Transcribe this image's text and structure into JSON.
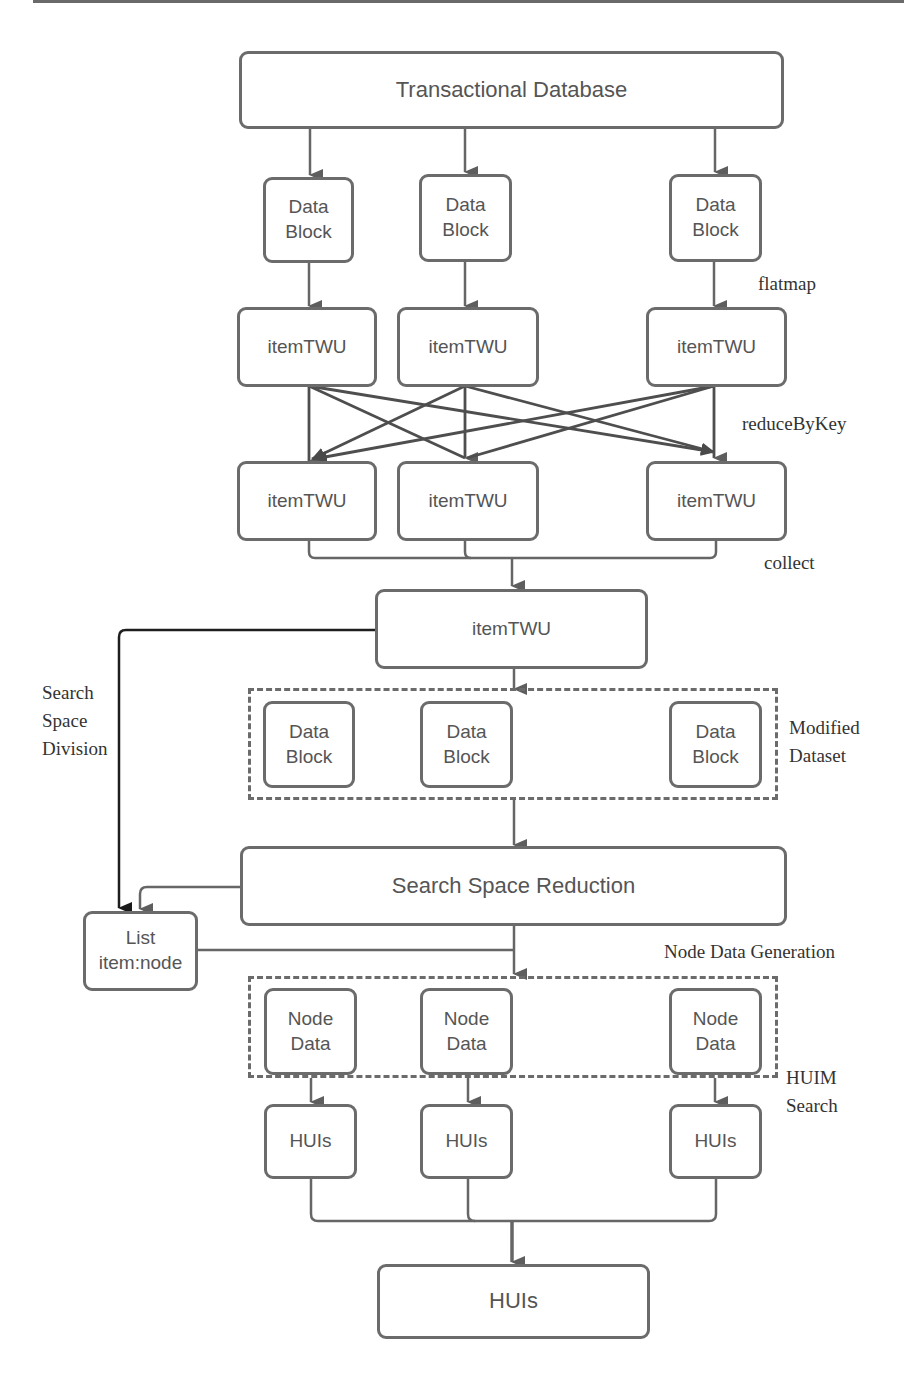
{
  "diagram": {
    "colors": {
      "stroke": "#6b6b6b",
      "dark_stroke": "#222222",
      "box_fill": "#ffffff",
      "text": "#555555",
      "label_text": "#333333"
    },
    "nodes": {
      "transactional_database": "Transactional Database",
      "data_block_1": {
        "line1": "Data",
        "line2": "Block"
      },
      "data_block_2": {
        "line1": "Data",
        "line2": "Block"
      },
      "data_block_3": {
        "line1": "Data",
        "line2": "Block"
      },
      "item_twu_map_1": "itemTWU",
      "item_twu_map_2": "itemTWU",
      "item_twu_map_3": "itemTWU",
      "item_twu_reduce_1": "itemTWU",
      "item_twu_reduce_2": "itemTWU",
      "item_twu_reduce_3": "itemTWU",
      "item_twu_collected": "itemTWU",
      "modified_data_block_1": {
        "line1": "Data",
        "line2": "Block"
      },
      "modified_data_block_2": {
        "line1": "Data",
        "line2": "Block"
      },
      "modified_data_block_3": {
        "line1": "Data",
        "line2": "Block"
      },
      "search_space_reduction": "Search Space Reduction",
      "list_item_node": {
        "line1": "List",
        "line2": "item:node"
      },
      "node_data_1": {
        "line1": "Node",
        "line2": "Data"
      },
      "node_data_2": {
        "line1": "Node",
        "line2": "Data"
      },
      "node_data_3": {
        "line1": "Node",
        "line2": "Data"
      },
      "huis_1": "HUIs",
      "huis_2": "HUIs",
      "huis_3": "HUIs",
      "huis_final": "HUIs"
    },
    "labels": {
      "flatmap": "flatmap",
      "reduce_by_key": "reduceByKey",
      "collect": "collect",
      "search_space_division": {
        "line1": "Search",
        "line2": "Space",
        "line3": "Division"
      },
      "modified_dataset": {
        "line1": "Modified",
        "line2": "Dataset"
      },
      "node_data_generation": "Node Data Generation",
      "huim_search": {
        "line1": "HUIM",
        "line2": "Search"
      }
    }
  }
}
